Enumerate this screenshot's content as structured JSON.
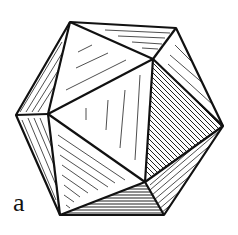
{
  "figure": {
    "label": "a",
    "stroke_color": "#111111",
    "background": "#ffffff"
  }
}
